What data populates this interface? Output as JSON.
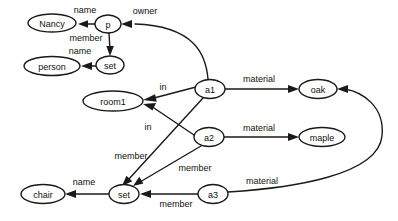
{
  "diagram": {
    "type": "directed-labeled-graph",
    "background_color": "#ffffff",
    "stroke_color": "#1a1a1a",
    "text_color": "#111111",
    "nodes": [
      {
        "id": "nancy",
        "label": "Nancy",
        "cx": 52,
        "cy": 23,
        "rx": 24,
        "ry": 9
      },
      {
        "id": "p",
        "label": "p",
        "cx": 108,
        "cy": 24,
        "rx": 13,
        "ry": 9
      },
      {
        "id": "set_top",
        "label": "set",
        "cx": 110,
        "cy": 65,
        "rx": 14,
        "ry": 9
      },
      {
        "id": "person",
        "label": "person",
        "cx": 52,
        "cy": 66,
        "rx": 28,
        "ry": 9.5
      },
      {
        "id": "room1",
        "label": "room1",
        "cx": 113,
        "cy": 101,
        "rx": 30,
        "ry": 10
      },
      {
        "id": "a1",
        "label": "a1",
        "cx": 210,
        "cy": 89,
        "rx": 15,
        "ry": 9.5
      },
      {
        "id": "a2",
        "label": "a2",
        "cx": 209,
        "cy": 137,
        "rx": 15,
        "ry": 9.5
      },
      {
        "id": "a3",
        "label": "a3",
        "cx": 213,
        "cy": 194,
        "rx": 15,
        "ry": 9.5
      },
      {
        "id": "oak",
        "label": "oak",
        "cx": 318,
        "cy": 89,
        "rx": 19,
        "ry": 9.5
      },
      {
        "id": "maple",
        "label": "maple",
        "cx": 322,
        "cy": 137,
        "rx": 23,
        "ry": 9.5
      },
      {
        "id": "set_bot",
        "label": "set",
        "cx": 124,
        "cy": 194,
        "rx": 15,
        "ry": 9.5
      },
      {
        "id": "chair",
        "label": "chair",
        "cx": 43,
        "cy": 194,
        "rx": 22,
        "ry": 9.5
      }
    ],
    "edges": [
      {
        "id": "p-nancy",
        "from": "p",
        "to": "nancy",
        "label": "name",
        "label_x": 85,
        "label_y": 10
      },
      {
        "id": "p-set",
        "from": "p",
        "to": "set_top",
        "label": "member",
        "label_x": 86,
        "label_y": 38
      },
      {
        "id": "set-person",
        "from": "set_top",
        "to": "person",
        "label": "name",
        "label_x": 80,
        "label_y": 51
      },
      {
        "id": "a1-p",
        "from": "a1",
        "to": "p",
        "label": "owner",
        "label_x": 145,
        "label_y": 11
      },
      {
        "id": "a1-room1",
        "from": "a1",
        "to": "room1",
        "label": "in",
        "label_x": 163,
        "label_y": 87
      },
      {
        "id": "a2-room1",
        "from": "a2",
        "to": "room1",
        "label": "in",
        "label_x": 148,
        "label_y": 127
      },
      {
        "id": "a1-oak",
        "from": "a1",
        "to": "oak",
        "label": "material",
        "label_x": 259,
        "label_y": 79
      },
      {
        "id": "a2-maple",
        "from": "a2",
        "to": "maple",
        "label": "material",
        "label_x": 259,
        "label_y": 128
      },
      {
        "id": "a3-oak",
        "from": "a3",
        "to": "oak",
        "label": "material",
        "label_x": 262,
        "label_y": 181
      },
      {
        "id": "a1-setbot",
        "from": "a1",
        "to": "set_bot",
        "label": "member",
        "label_x": 131,
        "label_y": 156
      },
      {
        "id": "a2-setbot",
        "from": "a2",
        "to": "set_bot",
        "label": "member",
        "label_x": 195,
        "label_y": 168
      },
      {
        "id": "a3-setbot",
        "from": "a3",
        "to": "set_bot",
        "label": "member",
        "label_x": 176,
        "label_y": 204
      },
      {
        "id": "setbot-chair",
        "from": "set_bot",
        "to": "chair",
        "label": "name",
        "label_x": 84,
        "label_y": 182
      }
    ]
  }
}
